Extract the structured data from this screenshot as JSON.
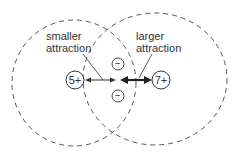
{
  "diagram": {
    "labels": {
      "smaller": "smaller\nattraction",
      "smaller_line1": "smaller",
      "smaller_line2": "attraction",
      "larger_line1": "larger",
      "larger_line2": "attraction"
    },
    "nuclei": {
      "left": "5+",
      "right": "7+"
    },
    "electrons": [
      "−",
      "−"
    ],
    "colors": {
      "stroke": "#333333",
      "dashed": "#555555",
      "background": "#ffffff"
    }
  }
}
